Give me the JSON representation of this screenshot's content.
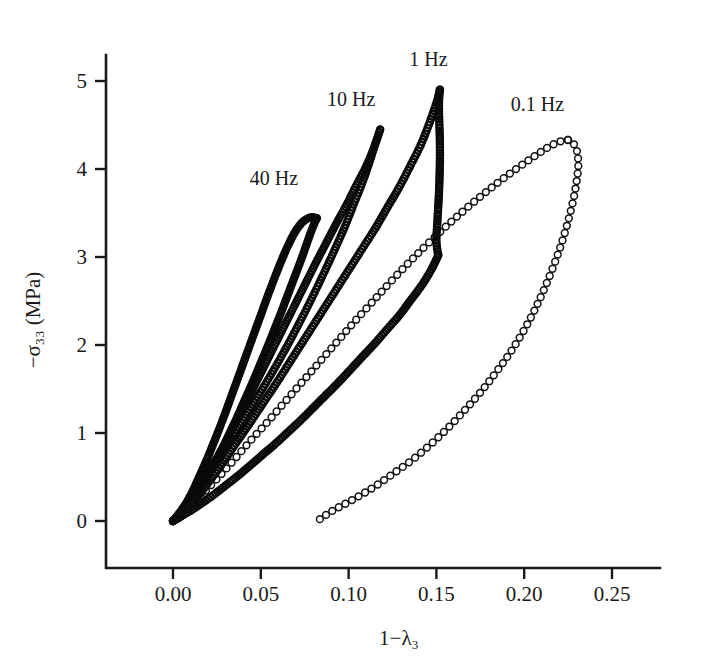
{
  "figure": {
    "background_color": "#ffffff",
    "ink_color": "#1a1a1a",
    "marker_style": "open-circle"
  },
  "chart_data": {
    "type": "scatter",
    "title": "",
    "subtitle": "",
    "xlabel": "1−λ₃",
    "ylabel": "−σ₃₃ (MPa)",
    "xlim": [
      -0.018,
      0.262
    ],
    "ylim": [
      -0.55,
      5.45
    ],
    "xticks": [
      0.0,
      0.05,
      0.1,
      0.15,
      0.2,
      0.25
    ],
    "xtick_labels": [
      "0.00",
      "0.05",
      "0.10",
      "0.15",
      "0.20",
      "0.25"
    ],
    "yticks": [
      0,
      1,
      2,
      3,
      4,
      5
    ],
    "ytick_labels": [
      "0",
      "1",
      "2",
      "3",
      "4",
      "5"
    ],
    "grid": false,
    "legend_position": "inline-annotations",
    "annotations": [
      {
        "text": "40 Hz",
        "x": 0.0575,
        "y": 3.82
      },
      {
        "text": "10 Hz",
        "x": 0.1015,
        "y": 4.72
      },
      {
        "text": "1 Hz",
        "x": 0.1455,
        "y": 5.17
      },
      {
        "text": "0.1 Hz",
        "x": 0.2075,
        "y": 4.66
      }
    ],
    "series": [
      {
        "name": "40 Hz",
        "label": "40 Hz",
        "marker": "open-circle",
        "loading": {
          "x": [
            0.0,
            0.0025,
            0.005,
            0.008,
            0.011,
            0.014,
            0.018,
            0.022,
            0.026,
            0.03,
            0.034,
            0.038,
            0.042,
            0.046,
            0.05,
            0.054,
            0.058,
            0.062,
            0.066,
            0.07,
            0.074,
            0.078,
            0.0805,
            0.082
          ],
          "y": [
            0.0,
            0.05,
            0.12,
            0.22,
            0.33,
            0.46,
            0.64,
            0.83,
            1.03,
            1.24,
            1.46,
            1.68,
            1.9,
            2.12,
            2.34,
            2.56,
            2.77,
            2.97,
            3.15,
            3.3,
            3.4,
            3.45,
            3.45,
            3.44
          ]
        },
        "unloading": {
          "x": [
            0.082,
            0.0805,
            0.0785,
            0.076,
            0.073,
            0.069,
            0.065,
            0.061,
            0.057,
            0.053,
            0.049,
            0.045,
            0.041,
            0.037,
            0.033,
            0.029,
            0.025,
            0.021,
            0.017,
            0.013,
            0.009,
            0.006,
            0.003,
            0.0
          ],
          "y": [
            3.44,
            3.38,
            3.28,
            3.14,
            2.97,
            2.76,
            2.55,
            2.34,
            2.14,
            1.94,
            1.75,
            1.56,
            1.38,
            1.2,
            1.03,
            0.86,
            0.7,
            0.55,
            0.41,
            0.28,
            0.16,
            0.08,
            0.03,
            0.0
          ]
        }
      },
      {
        "name": "10 Hz",
        "label": "10 Hz",
        "marker": "open-circle",
        "loading": {
          "x": [
            0.0,
            0.003,
            0.007,
            0.011,
            0.016,
            0.021,
            0.027,
            0.033,
            0.039,
            0.045,
            0.051,
            0.057,
            0.063,
            0.069,
            0.075,
            0.081,
            0.087,
            0.093,
            0.099,
            0.104,
            0.109,
            0.113,
            0.116,
            0.118
          ],
          "y": [
            0.0,
            0.06,
            0.15,
            0.26,
            0.41,
            0.58,
            0.79,
            1.01,
            1.24,
            1.48,
            1.72,
            1.96,
            2.2,
            2.44,
            2.68,
            2.92,
            3.15,
            3.38,
            3.6,
            3.8,
            3.99,
            4.17,
            4.33,
            4.45
          ]
        },
        "unloading": {
          "x": [
            0.118,
            0.1165,
            0.1145,
            0.112,
            0.108,
            0.103,
            0.098,
            0.092,
            0.086,
            0.08,
            0.074,
            0.068,
            0.062,
            0.056,
            0.05,
            0.044,
            0.038,
            0.032,
            0.026,
            0.02,
            0.015,
            0.01,
            0.005,
            0.0
          ],
          "y": [
            4.45,
            4.36,
            4.24,
            4.08,
            3.85,
            3.6,
            3.35,
            3.08,
            2.82,
            2.57,
            2.33,
            2.1,
            1.88,
            1.67,
            1.47,
            1.28,
            1.09,
            0.91,
            0.74,
            0.57,
            0.42,
            0.27,
            0.13,
            0.0
          ]
        }
      },
      {
        "name": "1 Hz",
        "label": "1 Hz",
        "marker": "open-circle",
        "loading": {
          "x": [
            0.0,
            0.004,
            0.009,
            0.015,
            0.021,
            0.028,
            0.035,
            0.043,
            0.051,
            0.059,
            0.067,
            0.075,
            0.083,
            0.091,
            0.099,
            0.107,
            0.115,
            0.122,
            0.129,
            0.135,
            0.141,
            0.146,
            0.15,
            0.152
          ],
          "y": [
            0.0,
            0.07,
            0.17,
            0.3,
            0.46,
            0.65,
            0.86,
            1.09,
            1.33,
            1.57,
            1.82,
            2.07,
            2.32,
            2.57,
            2.82,
            3.07,
            3.32,
            3.56,
            3.8,
            4.03,
            4.27,
            4.52,
            4.75,
            4.9
          ]
        },
        "unloading": {
          "x": [
            0.152,
            0.1515,
            0.1515,
            0.1518,
            0.152,
            0.152,
            0.1518,
            0.1515,
            0.151,
            0.1505,
            0.15,
            0.151
          ],
          "y": [
            4.9,
            4.78,
            4.62,
            4.45,
            4.28,
            4.1,
            3.92,
            3.74,
            3.56,
            3.38,
            3.18,
            3.02
          ]
        },
        "unloading2": {
          "x": [
            0.151,
            0.149,
            0.1455,
            0.141,
            0.135,
            0.129,
            0.122,
            0.115,
            0.108,
            0.101,
            0.094,
            0.087,
            0.08,
            0.073,
            0.066,
            0.059,
            0.052,
            0.045,
            0.038,
            0.031,
            0.024,
            0.017,
            0.011,
            0.005,
            0.0
          ],
          "y": [
            3.02,
            2.93,
            2.8,
            2.66,
            2.5,
            2.34,
            2.18,
            2.02,
            1.87,
            1.72,
            1.57,
            1.43,
            1.29,
            1.15,
            1.02,
            0.89,
            0.77,
            0.65,
            0.53,
            0.42,
            0.31,
            0.21,
            0.13,
            0.06,
            0.0
          ]
        }
      },
      {
        "name": "0.1 Hz",
        "label": "0.1 Hz",
        "marker": "open-circle",
        "loading": {
          "x": [
            0.0,
            0.005,
            0.011,
            0.018,
            0.026,
            0.035,
            0.044,
            0.054,
            0.064,
            0.074,
            0.084,
            0.094,
            0.104,
            0.114,
            0.124,
            0.134,
            0.144,
            0.154,
            0.164,
            0.174,
            0.184,
            0.194,
            0.204,
            0.213,
            0.22,
            0.225
          ],
          "y": [
            0.0,
            0.08,
            0.19,
            0.33,
            0.5,
            0.7,
            0.91,
            1.13,
            1.36,
            1.59,
            1.82,
            2.05,
            2.28,
            2.5,
            2.72,
            2.93,
            3.13,
            3.32,
            3.5,
            3.67,
            3.83,
            3.98,
            4.12,
            4.24,
            4.31,
            4.33
          ]
        },
        "unloading": {
          "x": [
            0.225,
            0.2275,
            0.2295,
            0.2305,
            0.2308,
            0.23,
            0.2285,
            0.2262,
            0.2232,
            0.2195,
            0.2152,
            0.2102,
            0.2045,
            0.1982,
            0.1912,
            0.1836,
            0.1754,
            0.1666,
            0.1572,
            0.1472,
            0.1366,
            0.1255,
            0.1155,
            0.1065,
            0.0985,
            0.092,
            0.0872,
            0.0842,
            0.0825
          ],
          "y": [
            4.33,
            4.3,
            4.24,
            4.15,
            4.03,
            3.88,
            3.7,
            3.5,
            3.28,
            3.05,
            2.82,
            2.58,
            2.34,
            2.11,
            1.89,
            1.68,
            1.47,
            1.27,
            1.07,
            0.88,
            0.7,
            0.54,
            0.4,
            0.29,
            0.2,
            0.13,
            0.07,
            0.03,
            0.0
          ]
        }
      }
    ]
  }
}
